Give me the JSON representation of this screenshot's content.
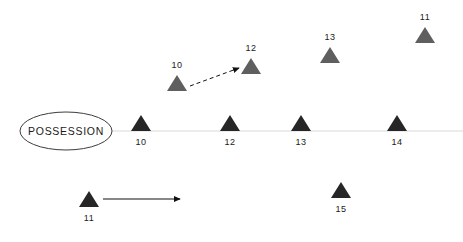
{
  "diagram": {
    "colors": {
      "dark_marker": "#262626",
      "gray_marker": "#5f5f5f",
      "baseline": "#d9d9d9",
      "outline": "#3d3d3d",
      "arrow": "#111111",
      "background": "#ffffff",
      "text": "#1a1a1a"
    },
    "possession_oval": {
      "label": "POSSESSION",
      "cx": 66,
      "cy": 131,
      "rx": 46,
      "ry": 19
    },
    "baseline": {
      "x1": 112,
      "x2": 463,
      "y": 131
    },
    "markers": [
      {
        "name": "baseline-marker-10",
        "label": "10",
        "shade": "dark",
        "label_pos": "below",
        "x": 141,
        "y": 131
      },
      {
        "name": "baseline-marker-12",
        "label": "12",
        "shade": "dark",
        "label_pos": "below",
        "x": 230,
        "y": 131
      },
      {
        "name": "baseline-marker-13",
        "label": "13",
        "shade": "dark",
        "label_pos": "below",
        "x": 301,
        "y": 131
      },
      {
        "name": "baseline-marker-14",
        "label": "14",
        "shade": "dark",
        "label_pos": "below",
        "x": 397,
        "y": 131
      },
      {
        "name": "upper-marker-10",
        "label": "10",
        "shade": "gray",
        "label_pos": "above",
        "x": 177,
        "y": 91
      },
      {
        "name": "upper-marker-12",
        "label": "12",
        "shade": "gray",
        "label_pos": "above",
        "x": 251,
        "y": 74
      },
      {
        "name": "upper-marker-13",
        "label": "13",
        "shade": "gray",
        "label_pos": "above",
        "x": 330,
        "y": 63
      },
      {
        "name": "upper-marker-11",
        "label": "11",
        "shade": "gray",
        "label_pos": "above",
        "x": 425,
        "y": 43
      },
      {
        "name": "lower-marker-11",
        "label": "11",
        "shade": "dark",
        "label_pos": "below",
        "x": 89,
        "y": 207
      },
      {
        "name": "lower-marker-15",
        "label": "15",
        "shade": "dark",
        "label_pos": "below",
        "x": 341,
        "y": 198
      }
    ],
    "arrows": [
      {
        "name": "dashed-movement-arrow",
        "style": "dashed",
        "x1": 190,
        "y1": 86,
        "x2": 239,
        "y2": 68
      },
      {
        "name": "solid-movement-arrow",
        "style": "solid",
        "x1": 103,
        "y1": 199,
        "x2": 180,
        "y2": 199
      }
    ]
  }
}
